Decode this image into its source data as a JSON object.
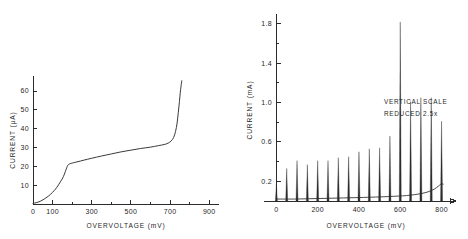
{
  "figure": {
    "background_color": "#ffffff",
    "ink_color": "#2b2b2b",
    "panel_count": 2
  },
  "chart_data": [
    {
      "panel": "left",
      "type": "line",
      "title": "",
      "xlabel": "OVERVOLTAGE (mV)",
      "ylabel": "CURRENT (µA)",
      "xlim": [
        0,
        950
      ],
      "ylim": [
        0,
        68
      ],
      "grid": false,
      "legend": null,
      "xticks": [
        0,
        100,
        300,
        500,
        700,
        900
      ],
      "xticklabels": [
        "0",
        "100",
        "300",
        "500",
        "700",
        "900"
      ],
      "xminorticks": [
        200,
        400,
        600,
        800
      ],
      "yticks": [
        10,
        20,
        30,
        40,
        50,
        60
      ],
      "yticklabels": [
        "10",
        "20",
        "30",
        "40",
        "50",
        "60"
      ],
      "series": [
        {
          "name": "current-voltage-characteristic",
          "x": [
            0,
            20,
            40,
            60,
            80,
            100,
            120,
            140,
            155,
            165,
            172,
            178,
            185,
            195,
            210,
            230,
            260,
            300,
            350,
            400,
            450,
            500,
            550,
            600,
            640,
            670,
            690,
            705,
            718,
            728,
            736,
            742,
            748,
            752,
            756,
            760
          ],
          "y": [
            0.3,
            0.8,
            1.6,
            2.8,
            4.3,
            6.2,
            8.6,
            11.8,
            14.5,
            17.2,
            19.2,
            20.6,
            21.2,
            21.6,
            22.0,
            22.5,
            23.3,
            24.3,
            25.5,
            26.6,
            27.7,
            28.6,
            29.5,
            30.2,
            31.0,
            31.6,
            32.3,
            33.4,
            35.3,
            38.5,
            43.0,
            48.5,
            54.5,
            59.0,
            62.5,
            65.5
          ]
        }
      ]
    },
    {
      "panel": "right",
      "type": "bar",
      "title": "",
      "xlabel": "OVERVOLTAGE (mV)",
      "ylabel": "CURRENT (mA)",
      "xlim": [
        -60,
        870
      ],
      "ylim": [
        0,
        1.9
      ],
      "grid": false,
      "legend": null,
      "xticks": [
        0,
        200,
        400,
        600,
        800
      ],
      "xticklabels": [
        "0",
        "200",
        "400",
        "600",
        "800"
      ],
      "xminorticks": [
        100,
        300,
        500,
        700
      ],
      "yticks": [
        0.2,
        0.6,
        1.0,
        1.4,
        1.8
      ],
      "yticklabels": [
        "0.2",
        "0.6",
        "1.0",
        "1.4",
        "1.8"
      ],
      "yminorticks": [
        0.4,
        0.8,
        1.2,
        1.6
      ],
      "annotations": [
        {
          "name": "vertical-scale-note",
          "lines": [
            "VERTICAL SCALE",
            "REDUCED 2.5x"
          ],
          "x": 610,
          "y": 1.28
        }
      ],
      "categories": [
        0,
        50,
        100,
        150,
        200,
        250,
        300,
        350,
        400,
        450,
        500,
        550,
        600,
        650,
        700,
        750,
        800
      ],
      "values": [
        0.17,
        0.33,
        0.41,
        0.37,
        0.41,
        0.41,
        0.44,
        0.45,
        0.5,
        0.53,
        0.54,
        0.66,
        1.82,
        1.01,
        1.05,
        1.05,
        0.81
      ],
      "series": [
        {
          "name": "spike-current",
          "x": [
            0,
            50,
            100,
            150,
            200,
            250,
            300,
            350,
            400,
            450,
            500,
            550,
            600,
            650,
            700,
            750,
            800
          ],
          "values": [
            0.17,
            0.33,
            0.41,
            0.37,
            0.41,
            0.41,
            0.44,
            0.45,
            0.5,
            0.53,
            0.54,
            0.66,
            1.82,
            1.01,
            1.05,
            1.05,
            0.81
          ]
        },
        {
          "name": "rising-baseline",
          "x": [
            0,
            100,
            200,
            300,
            400,
            480,
            540,
            590,
            630,
            670,
            700,
            730,
            755,
            775,
            790,
            800,
            810
          ],
          "y": [
            0.02,
            0.02,
            0.025,
            0.03,
            0.035,
            0.04,
            0.045,
            0.05,
            0.055,
            0.065,
            0.075,
            0.09,
            0.11,
            0.135,
            0.16,
            0.175,
            0.17
          ]
        }
      ]
    }
  ]
}
